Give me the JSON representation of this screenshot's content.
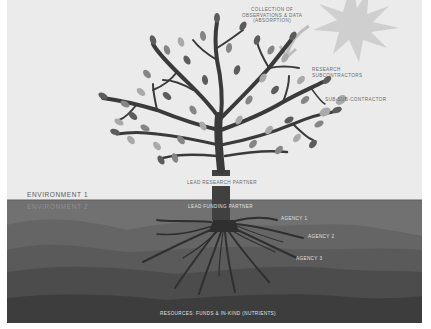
{
  "diagram": {
    "type": "tree-metaphor",
    "sky_labels": {
      "collection": "COLLECTION OF\nOBSERVATIONS & DATA\n(ABSORPTION)",
      "collection_lines": [
        "COLLECTION OF",
        "OBSERVATIONS & DATA",
        "(ABSORPTION)"
      ],
      "research_subcontractors_lines": [
        "RESEARCH",
        "SUBCONTRACTORS"
      ],
      "sub_sub_contractor": "SUB-SUB-CONTRACTOR",
      "lead_research_partner": "LEAD RESEARCH PARTNER"
    },
    "environments": {
      "env1": "ENVIRONMENT 1",
      "env2": "ENVIRONMENT 2"
    },
    "ground_labels": {
      "lead_funding_partner": "LEAD FUNDING PARTNER",
      "agency1": "AGENCY 1",
      "agency2": "AGENCY 2",
      "agency3": "AGENCY 3",
      "resources": "RESOURCES: FUNDS & IN-KIND (NUTRIENTS)"
    },
    "icons": {
      "sun": "sun-icon",
      "arrow": "curved-arrow-down-icon",
      "tree": "tree-icon",
      "roots": "roots-icon"
    },
    "colors": {
      "sky": "#ebebeb",
      "ground_layer_1": "#6f6f6f",
      "ground_layer_2": "#5f5f5f",
      "ground_layer_3": "#525252",
      "ground_layer_4": "#454545",
      "ground_layer_5": "#3a3a3a",
      "trunk": "#3f3f3f",
      "leaf_dark": "#5c5c5c",
      "leaf_mid": "#858585",
      "leaf_light": "#a9a9a9",
      "sun": "#cfcfcf"
    }
  }
}
